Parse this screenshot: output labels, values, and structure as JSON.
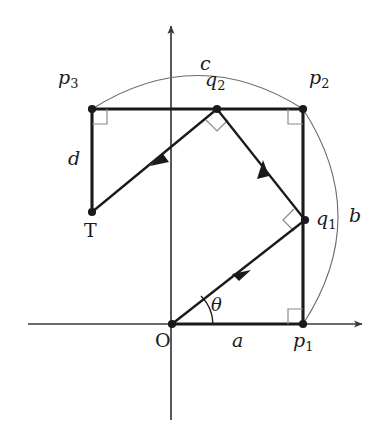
{
  "figure": {
    "type": "geometry-diagram",
    "background_color": "#ffffff",
    "line_color": "#1a1a1a",
    "thin_line_color": "#555555",
    "axes": {
      "x_axis": {
        "name": "x-axis",
        "from_x": 28,
        "to_x": 365,
        "y": 324,
        "arrow": "right"
      },
      "y_axis": {
        "name": "y-axis",
        "x": 171,
        "from_y": 420,
        "to_y": 22,
        "arrow": "up"
      }
    },
    "points": [
      {
        "id": "O",
        "label": "O",
        "x": 172,
        "y": 325,
        "label_x": 157,
        "label_y": 331
      },
      {
        "id": "p1",
        "label": "p",
        "sub": "1",
        "x": 303,
        "y": 324,
        "label_x": 293,
        "label_y": 331
      },
      {
        "id": "p2",
        "label": "p",
        "sub": "2",
        "x": 303,
        "y": 109,
        "label_x": 309,
        "label_y": 77
      },
      {
        "id": "p3",
        "label": "p",
        "sub": "3",
        "x": 92,
        "y": 109,
        "label_x": 58,
        "label_y": 77
      },
      {
        "id": "q1",
        "label": "q",
        "sub": "1",
        "x": 305,
        "y": 220,
        "label_x": 315,
        "label_y": 208
      },
      {
        "id": "q2",
        "label": "q",
        "sub": "2",
        "x": 217,
        "y": 109,
        "label_x": 206,
        "label_y": 79
      },
      {
        "id": "T",
        "label": "T",
        "x": 92,
        "y": 212,
        "label_x": 84,
        "label_y": 220
      }
    ],
    "segment_labels": [
      {
        "id": "a",
        "label": "a",
        "x": 236,
        "y": 334,
        "description": "base length O to p1"
      },
      {
        "id": "b",
        "label": "b",
        "x": 350,
        "y": 207,
        "description": "right arc p2 to p1"
      },
      {
        "id": "c",
        "label": "c",
        "x": 202,
        "y": 56,
        "description": "top arc p3 to p2"
      },
      {
        "id": "d",
        "label": "d",
        "x": 70,
        "y": 150,
        "description": "left side p3 to T"
      }
    ],
    "angle_labels": [
      {
        "id": "theta",
        "label": "θ",
        "x": 212,
        "y": 298,
        "description": "angle between x-axis and ray O to q1"
      }
    ],
    "rectangle_path": "O - p1 - p2 - p3",
    "ray_path": [
      {
        "from": "O",
        "to": "q1",
        "arrow": "midpoint-forward"
      },
      {
        "from": "q1",
        "to": "q2",
        "arrow": "midpoint-forward"
      },
      {
        "from": "q2",
        "to": "T",
        "arrow": "midpoint-forward"
      }
    ],
    "right_angle_marks": [
      {
        "at": "p1",
        "description": "right angle at p1 between base and right side"
      },
      {
        "at": "p2",
        "description": "right angle at p2 between top and right side"
      },
      {
        "at": "p3",
        "description": "right angle at p3 between top and left side"
      },
      {
        "at": "q1",
        "description": "right angle at q1 between incoming and outgoing ray"
      },
      {
        "at": "q2",
        "description": "right angle at q2 between incoming and outgoing ray"
      }
    ],
    "arcs": [
      {
        "id": "arc-c",
        "from": "p3",
        "to": "p2",
        "bulge": "up",
        "apex_y": 77
      },
      {
        "id": "arc-b",
        "from": "p2",
        "to": "p1",
        "bulge": "right",
        "apex_x": 345
      }
    ]
  }
}
